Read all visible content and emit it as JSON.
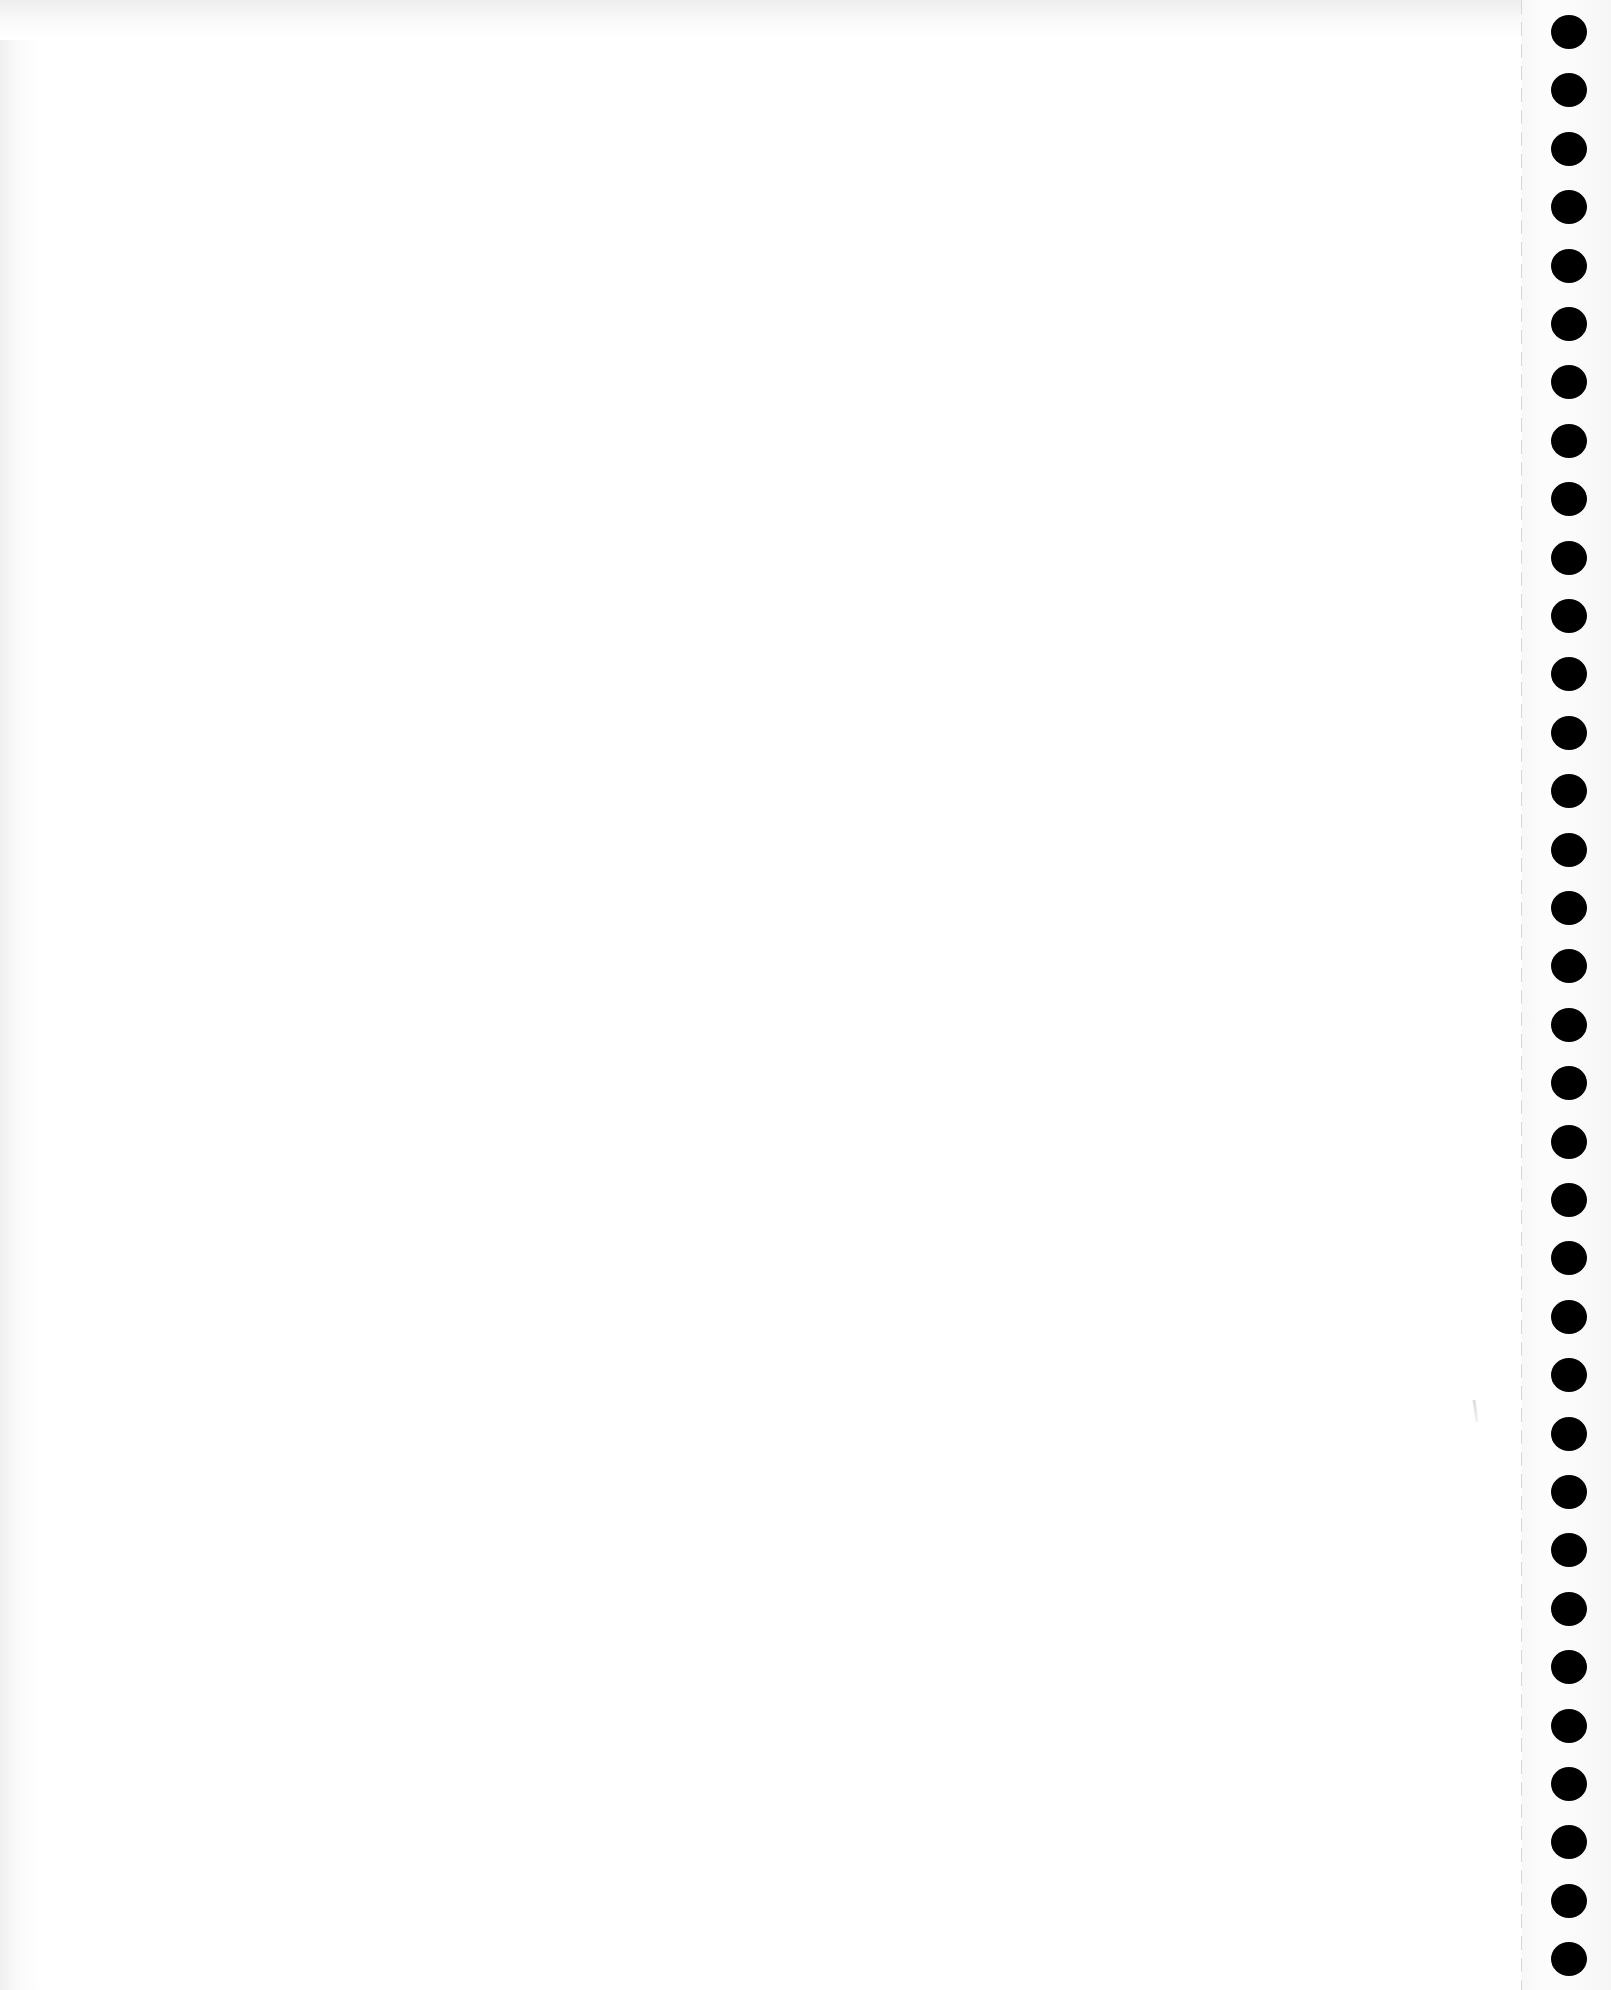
{
  "document": {
    "type": "blank notebook page",
    "content_text": "",
    "background_color": "#ffffff",
    "binding_side": "right",
    "hole_color": "#000000",
    "hole_count": 34,
    "hole_first_y": 15,
    "hole_spacing": 58.4,
    "perforation_line_x": 1521
  }
}
